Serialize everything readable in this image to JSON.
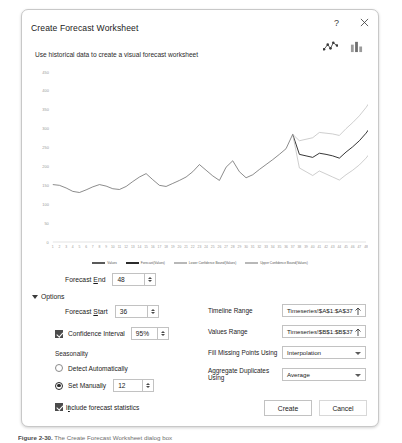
{
  "dialog": {
    "title": "Create Forecast Worksheet",
    "subtitle": "Use historical data to create a visual forecast worksheet",
    "help_label": "?",
    "close_label": "✕",
    "help_icon": "question-mark-icon",
    "close_icon": "close-icon",
    "chart_type_toggles": [
      {
        "name": "line-chart-toggle",
        "label": "Line Chart",
        "selected": true
      },
      {
        "name": "column-chart-toggle",
        "label": "Column Chart",
        "selected": false
      }
    ]
  },
  "forecast_end": {
    "label": "Forecast End",
    "value": "48"
  },
  "options": {
    "section_label": "Options",
    "expanded": true,
    "forecast_start": {
      "label": "Forecast Start",
      "value": "36"
    },
    "confidence_interval": {
      "label": "Confidence Interval",
      "checked": true,
      "value": "95%"
    },
    "seasonality": {
      "label": "Seasonality",
      "detect_label": "Detect Automatically",
      "manual_label": "Set Manually",
      "selected": "manual",
      "manual_value": "12"
    },
    "include_statistics": {
      "label": "Include forecast statistics",
      "checked": true
    },
    "timeline_range": {
      "label": "Timeline Range",
      "value": "Timeseries!$A$1:$A$37",
      "picker_icon": "range-picker-icon"
    },
    "values_range": {
      "label": "Values Range",
      "value": "Timeseries!$B$1:$B$37",
      "picker_icon": "range-picker-icon"
    },
    "fill_missing": {
      "label": "Fill Missing Points Using",
      "value": "Interpolation"
    },
    "aggregate_duplicates": {
      "label": "Aggregate Duplicates Using",
      "value": "Average"
    }
  },
  "footer": {
    "create_label": "Create",
    "cancel_label": "Cancel"
  },
  "caption": {
    "figure_label": "Figure 2-30.",
    "text": "The Create Forecast Worksheet dialog box"
  },
  "colors": {
    "dialog_border": "#c8c8c8",
    "field_border": "#c2c2c2",
    "historical_line": "#5a5a5a",
    "forecast_line": "#2b2b2b",
    "confidence_line": "#b8b8b8",
    "axis": "#d6d6d6",
    "text": "#1b1b1b"
  },
  "chart_data": {
    "type": "line",
    "title": "",
    "xlabel": "",
    "ylabel": "",
    "grid": false,
    "legend_position": "bottom",
    "ylim": [
      0,
      450
    ],
    "yticks": [
      0,
      50,
      100,
      150,
      200,
      250,
      300,
      350,
      400,
      450
    ],
    "xticks": [
      1,
      2,
      3,
      4,
      5,
      6,
      7,
      8,
      9,
      10,
      11,
      12,
      13,
      14,
      15,
      16,
      17,
      18,
      19,
      20,
      21,
      22,
      23,
      24,
      25,
      26,
      27,
      28,
      29,
      30,
      31,
      32,
      33,
      34,
      35,
      36,
      37,
      38,
      39,
      40,
      41,
      42,
      43,
      44,
      45,
      46,
      47,
      48
    ],
    "forecast_start_index": 36,
    "legend": [
      {
        "name": "Values",
        "color": "#5a5a5a"
      },
      {
        "name": "Forecast(Values)",
        "color": "#2b2b2b"
      },
      {
        "name": "Lower Confidence Bound(Values)",
        "color": "#b8b8b8"
      },
      {
        "name": "Upper Confidence Bound(Values)",
        "color": "#b8b8b8"
      }
    ],
    "series": [
      {
        "name": "Values",
        "color": "#5a5a5a",
        "values": [
          152,
          150,
          143,
          134,
          131,
          138,
          146,
          152,
          148,
          141,
          139,
          147,
          160,
          172,
          181,
          165,
          150,
          147,
          155,
          163,
          172,
          186,
          205,
          190,
          175,
          163,
          198,
          215,
          186,
          170,
          178,
          192,
          205,
          218,
          232,
          247,
          285,
          null,
          null,
          null,
          null,
          null,
          null,
          null,
          null,
          null,
          null,
          null
        ]
      },
      {
        "name": "Forecast(Values)",
        "color": "#2b2b2b",
        "values": [
          null,
          null,
          null,
          null,
          null,
          null,
          null,
          null,
          null,
          null,
          null,
          null,
          null,
          null,
          null,
          null,
          null,
          null,
          null,
          null,
          null,
          null,
          null,
          null,
          null,
          null,
          null,
          null,
          null,
          null,
          null,
          null,
          null,
          null,
          null,
          null,
          285,
          232,
          228,
          224,
          235,
          232,
          228,
          222,
          238,
          252,
          268,
          288,
          312
        ]
      },
      {
        "name": "Lower Confidence Bound(Values)",
        "color": "#b8b8b8",
        "values": [
          null,
          null,
          null,
          null,
          null,
          null,
          null,
          null,
          null,
          null,
          null,
          null,
          null,
          null,
          null,
          null,
          null,
          null,
          null,
          null,
          null,
          null,
          null,
          null,
          null,
          null,
          null,
          null,
          null,
          null,
          null,
          null,
          null,
          null,
          null,
          null,
          285,
          196,
          186,
          176,
          188,
          180,
          172,
          164,
          178,
          190,
          204,
          222,
          244
        ]
      },
      {
        "name": "Upper Confidence Bound(Values)",
        "color": "#b8b8b8",
        "values": [
          null,
          null,
          null,
          null,
          null,
          null,
          null,
          null,
          null,
          null,
          null,
          null,
          null,
          null,
          null,
          null,
          null,
          null,
          null,
          null,
          null,
          null,
          null,
          null,
          null,
          null,
          null,
          null,
          null,
          null,
          null,
          null,
          null,
          null,
          null,
          null,
          285,
          268,
          272,
          276,
          290,
          288,
          286,
          282,
          300,
          316,
          334,
          356,
          382
        ]
      }
    ]
  }
}
